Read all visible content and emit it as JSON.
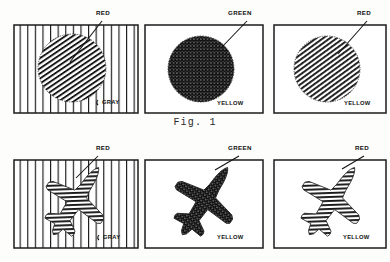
{
  "figure": {
    "caption": "Fig. 1",
    "rows": [
      {
        "row_id": "top-row",
        "subject": "circle",
        "panels": [
          {
            "panel_id": "top-left",
            "background_label": "GRAY",
            "background_pattern": "vertical-stripes",
            "object_label": "RED",
            "object_pattern": "diagonal-hatch",
            "object_shape": "circle"
          },
          {
            "panel_id": "top-middle",
            "background_label": "YELLOW",
            "background_pattern": "plain",
            "object_label": "GREEN",
            "object_pattern": "cross-hatch",
            "object_shape": "circle"
          },
          {
            "panel_id": "top-right",
            "background_label": "YELLOW",
            "background_pattern": "plain",
            "object_label": "RED",
            "object_pattern": "diagonal-hatch",
            "object_shape": "circle"
          }
        ]
      },
      {
        "row_id": "bottom-row",
        "subject": "airplane",
        "panels": [
          {
            "panel_id": "bottom-left",
            "background_label": "GRAY",
            "background_pattern": "vertical-stripes",
            "object_label": "RED",
            "object_pattern": "diagonal-hatch",
            "object_shape": "airplane"
          },
          {
            "panel_id": "bottom-middle",
            "background_label": "YELLOW",
            "background_pattern": "plain",
            "object_label": "GREEN",
            "object_pattern": "cross-hatch",
            "object_shape": "airplane"
          },
          {
            "panel_id": "bottom-right",
            "background_label": "YELLOW",
            "background_pattern": "plain",
            "object_label": "RED",
            "object_pattern": "diagonal-hatch",
            "object_shape": "airplane"
          }
        ]
      }
    ]
  },
  "colors": {
    "ink": "#121212",
    "paper": "#fdfdfc"
  }
}
